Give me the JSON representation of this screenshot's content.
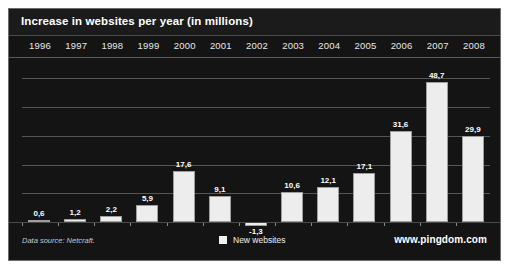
{
  "chart_data": {
    "type": "bar",
    "title": "Increase in websites per year (in millions)",
    "xlabel": "",
    "ylabel": "",
    "categories": [
      "1996",
      "1997",
      "1998",
      "1999",
      "2000",
      "2001",
      "2002",
      "2003",
      "2004",
      "2005",
      "2006",
      "2007",
      "2008"
    ],
    "values": [
      0.6,
      1.2,
      2.2,
      5.9,
      17.6,
      9.1,
      -1.3,
      10.6,
      12.1,
      17.1,
      31.6,
      48.7,
      29.9
    ],
    "value_labels": [
      "0,6",
      "1,2",
      "2,2",
      "5,9",
      "17,6",
      "9,1",
      "-1,3",
      "10,6",
      "12,1",
      "17,1",
      "31,6",
      "48,7",
      "29,9"
    ],
    "series": [
      {
        "name": "New websites",
        "values": [
          0.6,
          1.2,
          2.2,
          5.9,
          17.6,
          9.1,
          -1.3,
          10.6,
          12.1,
          17.1,
          31.6,
          48.7,
          29.9
        ],
        "color": "#ededed"
      }
    ],
    "ylim": [
      -5,
      55
    ],
    "gridlines": [
      10,
      20,
      30,
      40,
      50
    ],
    "grid": true,
    "legend_position": "bottom-center",
    "background": "#141414",
    "bar_color": "#ededed",
    "text_color": "#ffffff"
  },
  "legend": {
    "swatch_name": "legend-swatch-new-websites",
    "label": "New websites"
  },
  "footer": {
    "data_source": "Data source: Netcraft.",
    "watermark": "www.pingdom.com"
  }
}
